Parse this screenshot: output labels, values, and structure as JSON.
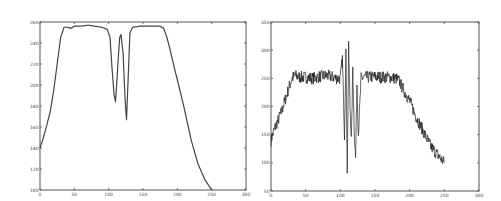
{
  "chart_data": [
    {
      "type": "line",
      "title": "",
      "xlabel": "",
      "ylabel": "",
      "xlim": [
        0,
        300
      ],
      "ylim": [
        100,
        260
      ],
      "xticks": [
        0,
        50,
        100,
        150,
        200,
        250,
        300
      ],
      "yticks": [
        100,
        120,
        140,
        160,
        180,
        200,
        220,
        240,
        260
      ],
      "grid": false,
      "legend": null,
      "series": [
        {
          "name": "smooth profile",
          "x": [
            0,
            5,
            10,
            15,
            20,
            25,
            30,
            35,
            40,
            45,
            50,
            60,
            70,
            80,
            90,
            98,
            102,
            105,
            108,
            110,
            113,
            116,
            118,
            121,
            124,
            126,
            128,
            131,
            135,
            145,
            160,
            175,
            180,
            185,
            190,
            195,
            200,
            210,
            220,
            230,
            240,
            250
          ],
          "y": [
            140,
            150,
            162,
            175,
            195,
            220,
            245,
            255,
            255,
            254,
            256,
            256,
            257,
            256,
            255,
            253,
            245,
            215,
            190,
            184,
            215,
            245,
            248,
            230,
            185,
            167,
            200,
            250,
            255,
            256,
            256,
            256,
            254,
            245,
            232,
            218,
            205,
            178,
            148,
            125,
            110,
            100
          ]
        }
      ]
    },
    {
      "type": "line",
      "title": "",
      "xlabel": "",
      "ylabel": "",
      "xlim": [
        0,
        300
      ],
      "ylim": [
        50,
        350
      ],
      "xticks": [
        0,
        50,
        100,
        150,
        200,
        250,
        300
      ],
      "yticks": [
        50,
        100,
        150,
        200,
        250,
        300,
        350
      ],
      "grid": false,
      "legend": null,
      "series": [
        {
          "name": "noisy profile",
          "x": [
            0,
            5,
            10,
            15,
            20,
            25,
            30,
            35,
            40,
            50,
            60,
            70,
            80,
            90,
            95,
            100,
            103,
            106,
            108,
            110,
            112,
            114,
            116,
            118,
            120,
            122,
            124,
            126,
            128,
            130,
            135,
            140,
            150,
            160,
            170,
            180,
            185,
            190,
            200,
            210,
            220,
            230,
            240,
            250
          ],
          "y": [
            140,
            160,
            175,
            190,
            210,
            230,
            250,
            255,
            252,
            252,
            250,
            253,
            255,
            252,
            250,
            250,
            285,
            150,
            300,
            88,
            305,
            200,
            140,
            270,
            160,
            108,
            240,
            150,
            200,
            250,
            252,
            252,
            253,
            252,
            252,
            250,
            245,
            232,
            210,
            180,
            155,
            130,
            115,
            100
          ]
        }
      ]
    }
  ],
  "axes": {
    "left": {
      "xtick_labels": [
        "0",
        "50",
        "100",
        "150",
        "200",
        "250",
        "300"
      ],
      "ytick_labels": [
        "100",
        "120",
        "140",
        "160",
        "180",
        "200",
        "220",
        "240",
        "260"
      ]
    },
    "right": {
      "xtick_labels": [
        "0",
        "50",
        "100",
        "150",
        "200",
        "250",
        "300"
      ],
      "ytick_labels": [
        "50",
        "100",
        "150",
        "200",
        "250",
        "300",
        "350"
      ]
    }
  }
}
